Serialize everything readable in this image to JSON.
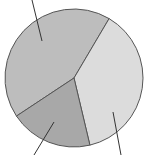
{
  "chart_data": {
    "type": "pie",
    "title": "",
    "categories": [
      "Slice A (top-left)",
      "Slice B (right)",
      "Slice C (bottom)"
    ],
    "values": [
      42.8,
      37.8,
      19.4
    ],
    "colors": [
      "#bdbdbd",
      "#dcdcdc",
      "#a8a8a8"
    ],
    "labels_visible": false,
    "leader_lines": true
  },
  "style": {
    "stroke": "#555555",
    "center": [
      74,
      78
    ],
    "radius": 69
  }
}
